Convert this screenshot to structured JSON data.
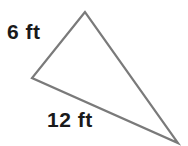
{
  "figure": {
    "type": "triangle-diagram",
    "background_color": "#ffffff",
    "stroke_color": "#7a7a7a",
    "stroke_width": 2.2,
    "label_color": "#1a1a1a",
    "canvas": {
      "width": 188,
      "height": 146
    },
    "vertices": [
      {
        "name": "apex",
        "x": 85,
        "y": 12
      },
      {
        "name": "left",
        "x": 32,
        "y": 78
      },
      {
        "name": "bottom-right",
        "x": 178,
        "y": 143
      }
    ],
    "polygon_points": "85,12 32,78 178,143",
    "labels": {
      "side_a": "6 ft",
      "side_b": "12 ft"
    },
    "measurements": [
      {
        "side": "apex-to-left",
        "value": 6,
        "unit": "ft",
        "text": "6 ft"
      },
      {
        "side": "left-to-bottom-right",
        "value": 12,
        "unit": "ft",
        "text": "12 ft"
      }
    ]
  }
}
